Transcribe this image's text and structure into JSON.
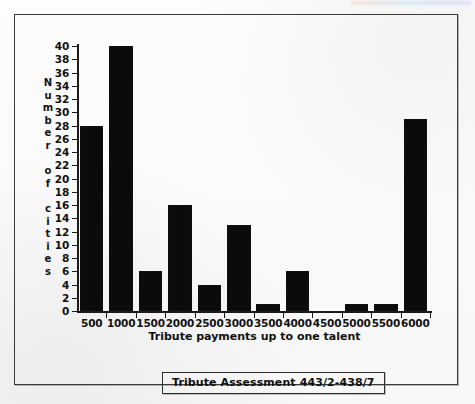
{
  "figure": {
    "caption": "Tribute  Assessment  443/2-438/7",
    "frame_color": "#3a3a3a",
    "bar_color": "#0b0b0b",
    "background": "#fbfbfb"
  },
  "chart_data": {
    "type": "bar",
    "title": "",
    "xlabel": "Tribute payments up to one talent",
    "ylabel": "Number of cities",
    "ylabel_letters": [
      "N",
      "u",
      "m",
      "b",
      "e",
      "r",
      "",
      "o",
      "f",
      "",
      "c",
      "i",
      "t",
      "i",
      "e",
      "s"
    ],
    "categories": [
      "500",
      "1000",
      "1500",
      "2000",
      "2500",
      "3000",
      "3500",
      "4000",
      "4500",
      "5000",
      "5500",
      "6000"
    ],
    "values": [
      28,
      40,
      6,
      16,
      4,
      13,
      1,
      6,
      0,
      1,
      1,
      29
    ],
    "ylim": [
      0,
      40
    ],
    "ytick_step": 2,
    "yticks": [
      0,
      2,
      4,
      6,
      8,
      10,
      12,
      14,
      16,
      18,
      20,
      22,
      24,
      26,
      28,
      30,
      32,
      34,
      36,
      38,
      40
    ],
    "ytick_labels": [
      "0",
      "2",
      "4",
      "6",
      "8",
      "10",
      "12",
      "14",
      "16",
      "18",
      "20",
      "22",
      "24",
      "26",
      "28",
      "30",
      "32",
      "34",
      "36",
      "38",
      "40"
    ],
    "grid": false,
    "legend": null
  }
}
